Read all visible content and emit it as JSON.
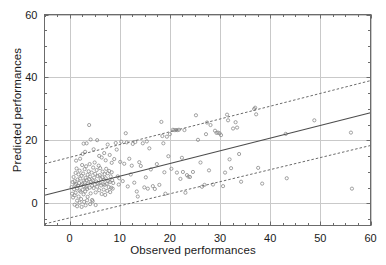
{
  "chart_data": {
    "type": "scatter",
    "title": "",
    "xlabel": "Observed performances",
    "ylabel": "Predicted performances",
    "xlim": [
      -5,
      60
    ],
    "ylim": [
      -7,
      60
    ],
    "xticks": [
      0,
      10,
      20,
      30,
      40,
      50,
      60
    ],
    "xticklabels": [
      "0",
      "10",
      "20",
      "30",
      "40",
      "50",
      "60"
    ],
    "yticks": [
      0,
      20,
      40,
      60
    ],
    "yticklabels": [
      "0",
      "20",
      "40",
      "60"
    ],
    "minor_tick_step_x": 2.5,
    "minor_tick_step_y": 5,
    "grid": true,
    "grid_color": "#c9c9c9",
    "axes_color": "#6b6b6b",
    "legend": null,
    "marker": {
      "style": "open-circle",
      "size": 3.2,
      "edge_color": "#8a8a8a",
      "fill": "none"
    },
    "series": [
      {
        "name": "observations",
        "type": "scatter",
        "points": [
          [
            0.4,
            5.2
          ],
          [
            0.5,
            3.1
          ],
          [
            0.6,
            6.8
          ],
          [
            0.7,
            1.9
          ],
          [
            0.8,
            8.4
          ],
          [
            0.9,
            4.5
          ],
          [
            1.0,
            7.1
          ],
          [
            1.0,
            2.6
          ],
          [
            1.1,
            5.9
          ],
          [
            1.2,
            9.7
          ],
          [
            1.2,
            3.4
          ],
          [
            1.3,
            6.2
          ],
          [
            1.4,
            11.1
          ],
          [
            1.5,
            4.8
          ],
          [
            1.5,
            0.9
          ],
          [
            1.6,
            7.6
          ],
          [
            1.7,
            5.5
          ],
          [
            1.8,
            2.2
          ],
          [
            1.8,
            9.2
          ],
          [
            1.9,
            6.5
          ],
          [
            2.0,
            4.1
          ],
          [
            2.0,
            10.4
          ],
          [
            2.1,
            7.9
          ],
          [
            2.2,
            3.7
          ],
          [
            2.3,
            5.8
          ],
          [
            2.3,
            1.4
          ],
          [
            2.4,
            8.8
          ],
          [
            2.5,
            6.1
          ],
          [
            2.5,
            12.2
          ],
          [
            2.6,
            4.3
          ],
          [
            2.7,
            9.5
          ],
          [
            2.8,
            7.2
          ],
          [
            2.8,
            2.9
          ],
          [
            2.9,
            5.4
          ],
          [
            3.0,
            10.9
          ],
          [
            3.0,
            6.7
          ],
          [
            3.1,
            3.8
          ],
          [
            3.2,
            8.1
          ],
          [
            3.3,
            5.1
          ],
          [
            3.3,
            11.8
          ],
          [
            3.4,
            7.4
          ],
          [
            3.5,
            4.6
          ],
          [
            3.6,
            9.1
          ],
          [
            3.6,
            2.1
          ],
          [
            3.7,
            6.3
          ],
          [
            3.8,
            10.2
          ],
          [
            3.9,
            7.7
          ],
          [
            4.0,
            5.0
          ],
          [
            4.0,
            12.5
          ],
          [
            4.1,
            8.5
          ],
          [
            4.2,
            3.2
          ],
          [
            4.3,
            6.9
          ],
          [
            4.4,
            9.8
          ],
          [
            4.5,
            5.6
          ],
          [
            4.5,
            1.1
          ],
          [
            4.6,
            7.3
          ],
          [
            4.7,
            11.4
          ],
          [
            4.8,
            4.9
          ],
          [
            4.9,
            8.2
          ],
          [
            5.0,
            6.0
          ],
          [
            5.0,
            13.0
          ],
          [
            5.1,
            9.4
          ],
          [
            5.2,
            3.5
          ],
          [
            5.3,
            7.0
          ],
          [
            5.4,
            10.6
          ],
          [
            5.5,
            5.3
          ],
          [
            5.6,
            8.7
          ],
          [
            5.7,
            6.4
          ],
          [
            5.8,
            12.0
          ],
          [
            5.9,
            4.2
          ],
          [
            6.0,
            9.0
          ],
          [
            6.0,
            6.6
          ],
          [
            6.1,
            11.2
          ],
          [
            6.2,
            7.8
          ],
          [
            6.3,
            5.7
          ],
          [
            6.4,
            3.0
          ],
          [
            6.5,
            8.3
          ],
          [
            6.6,
            10.1
          ],
          [
            6.7,
            6.1
          ],
          [
            6.8,
            4.4
          ],
          [
            6.9,
            7.5
          ],
          [
            7.0,
            9.3
          ],
          [
            7.0,
            5.9
          ],
          [
            7.1,
            2.7
          ],
          [
            7.2,
            8.0
          ],
          [
            7.3,
            11.0
          ],
          [
            7.4,
            6.2
          ],
          [
            7.5,
            4.0
          ],
          [
            7.6,
            9.6
          ],
          [
            7.7,
            7.1
          ],
          [
            7.8,
            5.2
          ],
          [
            7.9,
            10.3
          ],
          [
            8.0,
            6.8
          ],
          [
            8.1,
            3.6
          ],
          [
            8.2,
            8.6
          ],
          [
            8.3,
            5.0
          ],
          [
            8.4,
            9.9
          ],
          [
            8.5,
            7.4
          ],
          [
            8.6,
            4.7
          ],
          [
            8.7,
            6.5
          ],
          [
            1.0,
            -0.4
          ],
          [
            1.5,
            -0.9
          ],
          [
            2.0,
            0.2
          ],
          [
            2.4,
            -1.1
          ],
          [
            2.9,
            0.5
          ],
          [
            3.2,
            -0.6
          ],
          [
            3.5,
            1.0
          ],
          [
            4.1,
            -0.2
          ],
          [
            4.6,
            0.7
          ],
          [
            5.2,
            -0.5
          ],
          [
            1.3,
            13.6
          ],
          [
            2.1,
            14.2
          ],
          [
            2.6,
            15.7
          ],
          [
            3.1,
            16.4
          ],
          [
            3.4,
            19.1
          ],
          [
            2.8,
            19.0
          ],
          [
            3.9,
            24.9
          ],
          [
            4.2,
            20.3
          ],
          [
            4.8,
            17.2
          ],
          [
            5.5,
            20.1
          ],
          [
            5.9,
            15.1
          ],
          [
            6.4,
            14.6
          ],
          [
            6.9,
            16.0
          ],
          [
            7.2,
            13.7
          ],
          [
            7.6,
            18.7
          ],
          [
            8.0,
            15.4
          ],
          [
            8.4,
            12.9
          ],
          [
            8.9,
            14.1
          ],
          [
            9.2,
            19.2
          ],
          [
            9.4,
            17.1
          ],
          [
            9.6,
            8.6
          ],
          [
            9.8,
            6.0
          ],
          [
            9.9,
            8.0
          ],
          [
            10.1,
            13.2
          ],
          [
            10.3,
            19.6
          ],
          [
            10.6,
            7.1
          ],
          [
            10.9,
            12.6
          ],
          [
            11.2,
            22.3
          ],
          [
            11.4,
            19.4
          ],
          [
            11.6,
            5.4
          ],
          [
            11.9,
            14.2
          ],
          [
            12.2,
            9.2
          ],
          [
            12.4,
            12.0
          ],
          [
            12.6,
            18.9
          ],
          [
            12.9,
            6.6
          ],
          [
            13.1,
            19.5
          ],
          [
            13.4,
            3.8
          ],
          [
            13.6,
            2.2
          ],
          [
            13.9,
            13.1
          ],
          [
            14.2,
            11.9
          ],
          [
            14.6,
            19.1
          ],
          [
            14.9,
            5.1
          ],
          [
            15.2,
            8.3
          ],
          [
            15.4,
            19.7
          ],
          [
            15.6,
            4.7
          ],
          [
            15.9,
            17.5
          ],
          [
            16.2,
            10.8
          ],
          [
            16.6,
            5.5
          ],
          [
            17.0,
            4.6
          ],
          [
            17.4,
            12.5
          ],
          [
            17.9,
            5.9
          ],
          [
            18.3,
            25.9
          ],
          [
            18.5,
            21.4
          ],
          [
            18.7,
            19.1
          ],
          [
            18.9,
            9.9
          ],
          [
            19.1,
            3.1
          ],
          [
            19.4,
            21.2
          ],
          [
            19.7,
            15.0
          ],
          [
            20.0,
            22.0
          ],
          [
            20.3,
            11.0
          ],
          [
            20.6,
            23.4
          ],
          [
            20.9,
            23.3
          ],
          [
            21.2,
            23.3
          ],
          [
            21.5,
            23.3
          ],
          [
            21.8,
            23.4
          ],
          [
            21.4,
            9.8
          ],
          [
            22.1,
            7.8
          ],
          [
            22.4,
            14.5
          ],
          [
            22.6,
            10.0
          ],
          [
            22.9,
            23.3
          ],
          [
            23.1,
            3.4
          ],
          [
            23.4,
            9.0
          ],
          [
            23.7,
            8.5
          ],
          [
            24.0,
            8.4
          ],
          [
            24.6,
            10.0
          ],
          [
            25.2,
            28.0
          ],
          [
            25.6,
            20.2
          ],
          [
            26.1,
            13.0
          ],
          [
            26.4,
            5.3
          ],
          [
            26.9,
            5.9
          ],
          [
            27.2,
            22.0
          ],
          [
            27.4,
            25.7
          ],
          [
            27.8,
            10.5
          ],
          [
            28.1,
            24.9
          ],
          [
            28.6,
            6.0
          ],
          [
            29.0,
            23.1
          ],
          [
            29.3,
            22.4
          ],
          [
            29.6,
            22.5
          ],
          [
            29.9,
            22.3
          ],
          [
            30.2,
            21.7
          ],
          [
            30.6,
            5.5
          ],
          [
            31.0,
            9.8
          ],
          [
            31.4,
            28.2
          ],
          [
            31.6,
            26.4
          ],
          [
            31.9,
            14.0
          ],
          [
            32.2,
            11.2
          ],
          [
            32.6,
            23.8
          ],
          [
            33.1,
            25.8
          ],
          [
            33.4,
            24.1
          ],
          [
            33.8,
            15.7
          ],
          [
            34.2,
            6.9
          ],
          [
            36.8,
            30.0
          ],
          [
            37.0,
            30.4
          ],
          [
            37.2,
            28.3
          ],
          [
            37.6,
            11.3
          ],
          [
            38.4,
            6.3
          ],
          [
            43.1,
            22.1
          ],
          [
            43.3,
            8.0
          ],
          [
            48.8,
            26.4
          ],
          [
            56.1,
            22.5
          ],
          [
            56.3,
            4.7
          ]
        ]
      },
      {
        "name": "regression-line",
        "type": "line",
        "style": "solid",
        "color": "#4d4d4d",
        "x": [
          -5,
          60
        ],
        "y": [
          2.6,
          28.8
        ]
      },
      {
        "name": "upper-prediction-bound",
        "type": "line",
        "style": "dotted",
        "color": "#6b6b6b",
        "x": [
          -5,
          60
        ],
        "y": [
          12.6,
          39.0
        ]
      },
      {
        "name": "lower-prediction-bound",
        "type": "line",
        "style": "dotted",
        "color": "#6b6b6b",
        "x": [
          -5,
          60
        ],
        "y": [
          -6.5,
          18.4
        ]
      }
    ]
  }
}
